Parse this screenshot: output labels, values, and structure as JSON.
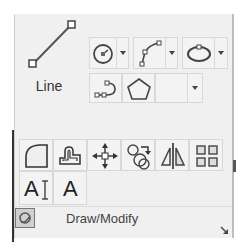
{
  "panel": {
    "title": "Draw/Modify"
  },
  "draw": {
    "line_label": "Line",
    "tools": [
      {
        "name": "circle",
        "has_dropdown": true
      },
      {
        "name": "polyline-arc",
        "has_dropdown": true
      },
      {
        "name": "ellipse",
        "has_dropdown": true
      },
      {
        "name": "spline"
      },
      {
        "name": "polygon"
      },
      {
        "name": "empty",
        "has_dropdown": true
      }
    ]
  },
  "modify": {
    "tools": [
      "fillet",
      "offset",
      "move",
      "copy",
      "mirror",
      "array"
    ]
  },
  "text": {
    "tools": [
      {
        "name": "text-edit",
        "glyph": "A"
      },
      {
        "name": "text",
        "glyph": "A"
      }
    ]
  }
}
